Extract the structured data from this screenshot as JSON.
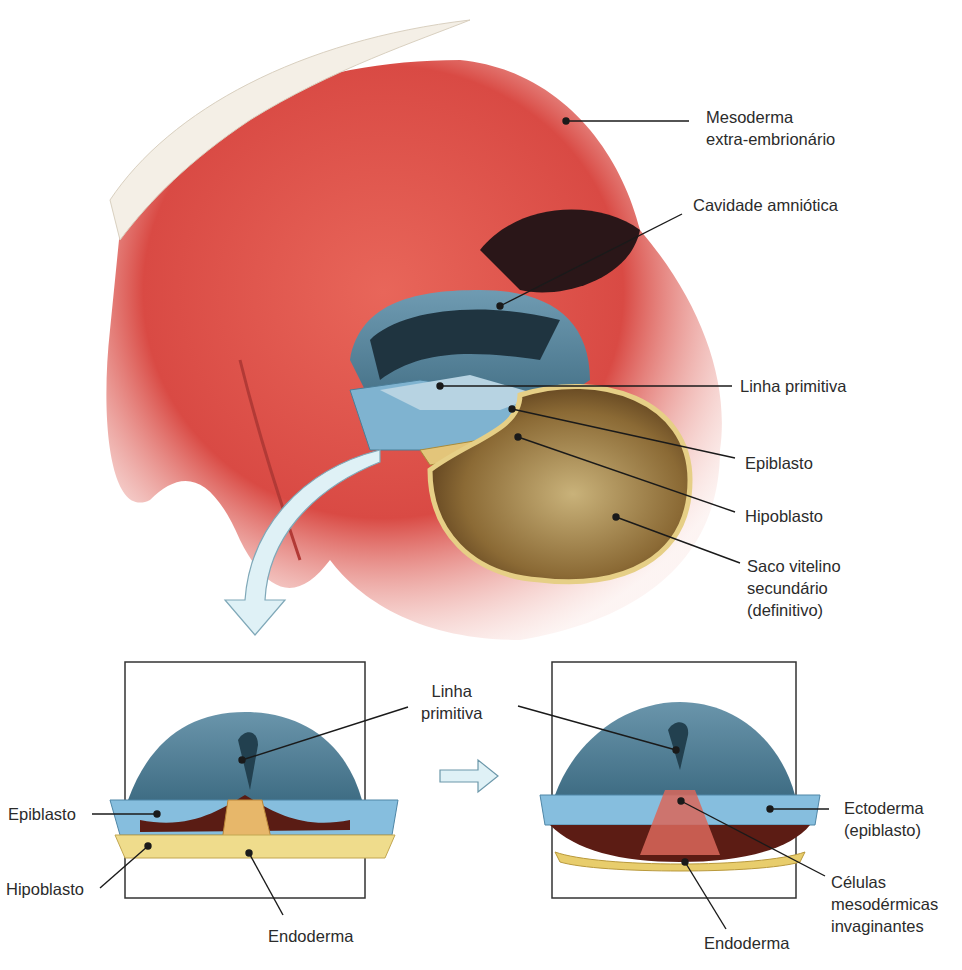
{
  "top_figure": {
    "labels": {
      "mesoderm_line1": "Mesoderma",
      "mesoderm_line2": "extra-embrionário",
      "amniotic_cavity": "Cavidade amniótica",
      "primitive_streak": "Linha primitiva",
      "epiblast": "Epiblasto",
      "hypoblast": "Hipoblasto",
      "yolk_sac_line1": "Saco vitelino",
      "yolk_sac_line2": "secundário",
      "yolk_sac_line3": "(definitivo)"
    }
  },
  "bottom_left_figure": {
    "labels": {
      "primitive_streak_line1": "Linha",
      "primitive_streak_line2": "primitiva",
      "epiblast": "Epiblasto",
      "hypoblast": "Hipoblasto",
      "endoderm": "Endoderma"
    }
  },
  "bottom_right_figure": {
    "labels": {
      "ectoderm_line1": "Ectoderma",
      "ectoderm_line2": "(epiblasto)",
      "mesoderm_cells_line1": "Células",
      "mesoderm_cells_line2": "mesodérmicas",
      "mesoderm_cells_line3": "invaginantes",
      "endoderm": "Endoderma"
    }
  },
  "colors": {
    "mesoderm_red": "#e0524a",
    "epiblast_blue": "#6fa6c4",
    "amnion_teal": "#4f7f96",
    "yolk_yellow": "#d9c27a",
    "yolk_brown": "#8a6a30",
    "arrow_fill": "#dff1f6",
    "leader_line": "#1a1a1a"
  }
}
